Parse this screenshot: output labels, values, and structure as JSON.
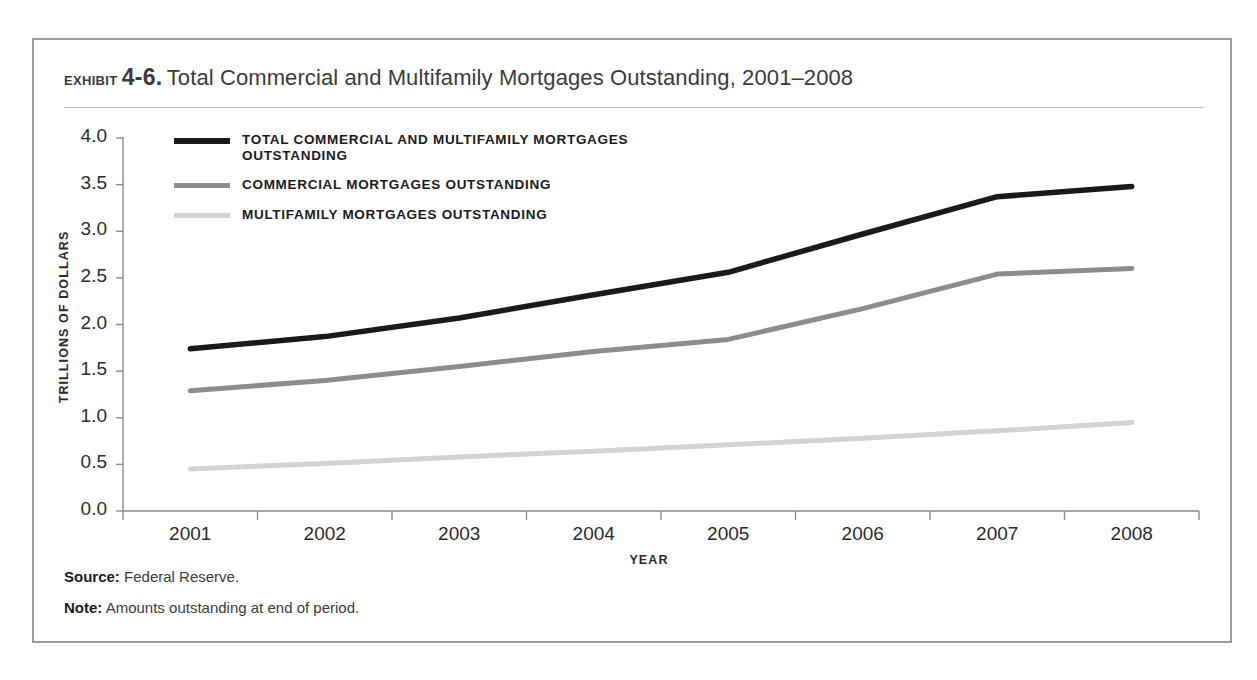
{
  "exhibit": {
    "label": "Exhibit",
    "number": "4-6.",
    "title": "Total Commercial and Multifamily Mortgages Outstanding, 2001–2008"
  },
  "footnotes": {
    "source_label": "Source:",
    "source_text": "Federal Reserve.",
    "note_label": "Note:",
    "note_text": "Amounts outstanding at end of period."
  },
  "colors": {
    "total": "#1a1a1a",
    "commercial": "#8c8c8c",
    "multifamily": "#d2d2d2",
    "axis": "#8a8a8a",
    "frame": "#9a9a9a",
    "text": "#2b2b2b"
  },
  "chart_data": {
    "type": "line",
    "title": "Total Commercial and Multifamily Mortgages Outstanding, 2001–2008",
    "xlabel": "YEAR",
    "ylabel": "TRILLIONS OF DOLLARS",
    "categories": [
      "2001",
      "2002",
      "2003",
      "2004",
      "2005",
      "2006",
      "2007",
      "2008"
    ],
    "ylim": [
      0.0,
      4.0
    ],
    "yticks": [
      "0.0",
      "0.5",
      "1.0",
      "1.5",
      "2.0",
      "2.5",
      "3.0",
      "3.5",
      "4.0"
    ],
    "ytick_values": [
      0.0,
      0.5,
      1.0,
      1.5,
      2.0,
      2.5,
      3.0,
      3.5,
      4.0
    ],
    "grid": false,
    "legend_position": "top-left inside",
    "series": [
      {
        "name": "TOTAL COMMERCIAL AND MULTIFAMILY MORTGAGES OUTSTANDING",
        "color": "#1a1a1a",
        "width": 5.5,
        "values": [
          1.74,
          1.87,
          2.07,
          2.32,
          2.56,
          2.97,
          3.37,
          3.48
        ]
      },
      {
        "name": "COMMERCIAL MORTGAGES OUTSTANDING",
        "color": "#8c8c8c",
        "width": 5.0,
        "values": [
          1.29,
          1.4,
          1.55,
          1.71,
          1.84,
          2.17,
          2.54,
          2.6
        ]
      },
      {
        "name": "MULTIFAMILY MORTGAGES OUTSTANDING",
        "color": "#d2d2d2",
        "width": 5.0,
        "values": [
          0.45,
          0.51,
          0.58,
          0.64,
          0.71,
          0.78,
          0.86,
          0.95
        ]
      }
    ]
  }
}
